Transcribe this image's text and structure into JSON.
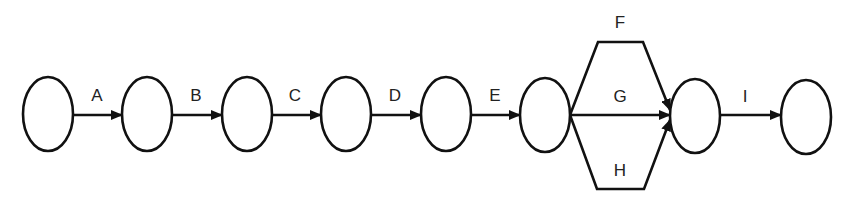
{
  "diagram": {
    "type": "activity-on-arrow network",
    "stroke_color": "#111111",
    "nodes": [
      {
        "id": "n1",
        "cx": 48,
        "cy": 115
      },
      {
        "id": "n2",
        "cx": 147,
        "cy": 115
      },
      {
        "id": "n3",
        "cx": 247,
        "cy": 115
      },
      {
        "id": "n4",
        "cx": 346,
        "cy": 115
      },
      {
        "id": "n5",
        "cx": 446,
        "cy": 115
      },
      {
        "id": "n6",
        "cx": 545,
        "cy": 115
      },
      {
        "id": "n7",
        "cx": 695,
        "cy": 115
      },
      {
        "id": "n8",
        "cx": 806,
        "cy": 115
      }
    ],
    "edges": [
      {
        "label": "A",
        "from": "n1",
        "to": "n2"
      },
      {
        "label": "B",
        "from": "n2",
        "to": "n3"
      },
      {
        "label": "C",
        "from": "n3",
        "to": "n4"
      },
      {
        "label": "D",
        "from": "n4",
        "to": "n5"
      },
      {
        "label": "E",
        "from": "n5",
        "to": "n6"
      },
      {
        "label": "F",
        "from": "n6",
        "to": "n7",
        "route": "upper"
      },
      {
        "label": "G",
        "from": "n6",
        "to": "n7",
        "route": "straight"
      },
      {
        "label": "H",
        "from": "n6",
        "to": "n7",
        "route": "lower"
      },
      {
        "label": "I",
        "from": "n7",
        "to": "n8"
      }
    ]
  }
}
